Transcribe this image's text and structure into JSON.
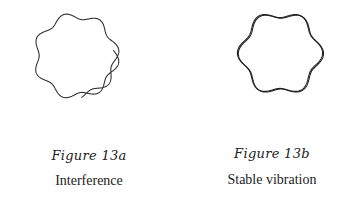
{
  "figures": [
    {
      "id": "13a",
      "label": "Figure 13a",
      "caption": "Interference",
      "drawing": {
        "shape": "open wavy ring (waveform overlaps itself, does not close)",
        "lobes": 7,
        "stroke_color": "#333333"
      }
    },
    {
      "id": "13b",
      "label": "Figure 13b",
      "caption": "Stable vibration",
      "drawing": {
        "shape": "closed wavy ring (standing wave)",
        "lobes": 6,
        "stroke_color": "#222222"
      }
    }
  ]
}
